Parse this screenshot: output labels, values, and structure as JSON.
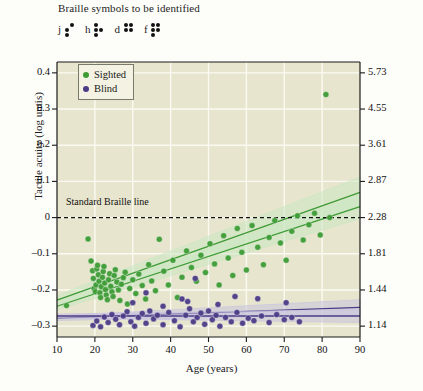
{
  "header": {
    "caption": "Braille symbols to be identified",
    "braille": [
      {
        "letter": "j",
        "dots": [
          0,
          1,
          1,
          1,
          0,
          0
        ]
      },
      {
        "letter": "h",
        "dots": [
          1,
          1,
          1,
          0,
          1,
          0
        ]
      },
      {
        "letter": "d",
        "dots": [
          1,
          1,
          0,
          1,
          1,
          0
        ]
      },
      {
        "letter": "f",
        "dots": [
          1,
          1,
          1,
          1,
          1,
          0
        ]
      }
    ]
  },
  "legend": {
    "position": "top-left-inside",
    "items": [
      {
        "label": "Sighted",
        "color": "#3d9b35"
      },
      {
        "label": "Blind",
        "color": "#4b3b86"
      }
    ]
  },
  "annotations": {
    "standard_braille_line": "Standard Braille line"
  },
  "colors": {
    "plot_background": "#e7e5cd",
    "grid": "#fbfaf2",
    "sighted": "#3d9b35",
    "blind": "#4b3b86",
    "sighted_band": "#cbe7c3",
    "blind_band": "#c9c4e0",
    "axis": "#1b1b1b",
    "page_background": "#fdfdfa"
  },
  "chart_data": {
    "type": "scatter",
    "title": "",
    "xlabel": "Age (years)",
    "ylabel": "Tactile acuity (log untis)",
    "ylabel_right": "Tactile acuity (mm)",
    "xlim": [
      10,
      90
    ],
    "ylim": [
      -0.33,
      0.43
    ],
    "grid": true,
    "xticks": [
      10,
      20,
      30,
      40,
      50,
      60,
      70,
      80,
      90
    ],
    "xticklabels": [
      "10",
      "20",
      "30",
      "40",
      "50",
      "60",
      "70",
      "80",
      "90"
    ],
    "yticks": [
      0.4,
      0.3,
      0.2,
      0.1,
      0,
      -0.1,
      -0.2,
      -0.3
    ],
    "yticklabels": [
      "0.4",
      "0.3",
      "0.2",
      "0.1",
      "0",
      "–0.1",
      "–0.2",
      "–0.3"
    ],
    "y2ticks": [
      0.4,
      0.3,
      0.2,
      0.1,
      0.0,
      -0.1,
      -0.2,
      -0.3
    ],
    "y2ticklabels": [
      "5.73",
      "4.55",
      "3.61",
      "2.87",
      "2.28",
      "1.81",
      "1.44",
      "1.14"
    ],
    "hlines": [
      {
        "y": 0,
        "style": "dashed",
        "label": "Standard Braille line"
      }
    ],
    "series": [
      {
        "name": "Sighted",
        "color": "#3d9b35",
        "points": [
          [
            12.5,
            -0.243
          ],
          [
            18.2,
            -0.059
          ],
          [
            19.0,
            -0.12
          ],
          [
            19.4,
            -0.147
          ],
          [
            19.6,
            -0.168
          ],
          [
            19.8,
            -0.196
          ],
          [
            20.1,
            -0.205
          ],
          [
            20.3,
            -0.186
          ],
          [
            20.5,
            -0.142
          ],
          [
            20.7,
            -0.132
          ],
          [
            20.9,
            -0.158
          ],
          [
            21.1,
            -0.176
          ],
          [
            21.3,
            -0.208
          ],
          [
            21.5,
            -0.221
          ],
          [
            21.7,
            -0.191
          ],
          [
            22.0,
            -0.165
          ],
          [
            22.2,
            -0.149
          ],
          [
            22.4,
            -0.135
          ],
          [
            22.6,
            -0.181
          ],
          [
            22.8,
            -0.199
          ],
          [
            23.0,
            -0.214
          ],
          [
            23.3,
            -0.227
          ],
          [
            23.6,
            -0.172
          ],
          [
            23.9,
            -0.155
          ],
          [
            24.2,
            -0.19
          ],
          [
            24.5,
            -0.205
          ],
          [
            24.8,
            -0.218
          ],
          [
            25.1,
            -0.16
          ],
          [
            25.4,
            -0.144
          ],
          [
            25.8,
            -0.178
          ],
          [
            26.2,
            -0.2
          ],
          [
            26.6,
            -0.229
          ],
          [
            27.0,
            -0.184
          ],
          [
            27.5,
            -0.166
          ],
          [
            28.0,
            -0.151
          ],
          [
            28.6,
            -0.239
          ],
          [
            29.2,
            -0.196
          ],
          [
            30.0,
            -0.172
          ],
          [
            30.8,
            -0.21
          ],
          [
            31.6,
            -0.156
          ],
          [
            32.5,
            -0.188
          ],
          [
            33.4,
            -0.225
          ],
          [
            34.2,
            -0.13
          ],
          [
            35.0,
            -0.175
          ],
          [
            36.0,
            -0.202
          ],
          [
            37.0,
            -0.06
          ],
          [
            38.2,
            -0.148
          ],
          [
            39.4,
            -0.186
          ],
          [
            40.6,
            -0.118
          ],
          [
            41.8,
            -0.221
          ],
          [
            43.0,
            -0.165
          ],
          [
            44.2,
            -0.092
          ],
          [
            45.5,
            -0.138
          ],
          [
            46.8,
            -0.176
          ],
          [
            48.0,
            -0.104
          ],
          [
            49.2,
            -0.152
          ],
          [
            50.4,
            -0.072
          ],
          [
            51.6,
            -0.128
          ],
          [
            52.8,
            -0.186
          ],
          [
            54.0,
            -0.05
          ],
          [
            55.2,
            -0.112
          ],
          [
            56.4,
            -0.16
          ],
          [
            57.6,
            -0.03
          ],
          [
            58.8,
            -0.096
          ],
          [
            60.0,
            -0.145
          ],
          [
            61.5,
            -0.022
          ],
          [
            63.0,
            -0.082
          ],
          [
            64.5,
            -0.13
          ],
          [
            66.0,
            -0.055
          ],
          [
            67.5,
            -0.008
          ],
          [
            69.0,
            -0.07
          ],
          [
            70.5,
            -0.118
          ],
          [
            72.0,
            -0.038
          ],
          [
            73.5,
            0.005
          ],
          [
            75.0,
            -0.062
          ],
          [
            76.5,
            -0.02
          ],
          [
            78.0,
            0.012
          ],
          [
            79.5,
            -0.048
          ],
          [
            81.0,
            0.34
          ],
          [
            82.0,
            0.0
          ]
        ]
      },
      {
        "name": "Blind",
        "color": "#4b3b86",
        "points": [
          [
            19.5,
            -0.298
          ],
          [
            20.5,
            -0.286
          ],
          [
            21.5,
            -0.302
          ],
          [
            22.5,
            -0.275
          ],
          [
            23.5,
            -0.29
          ],
          [
            24.5,
            -0.268
          ],
          [
            25.5,
            -0.281
          ],
          [
            26.5,
            -0.296
          ],
          [
            27.5,
            -0.272
          ],
          [
            28.5,
            -0.26
          ],
          [
            29.5,
            -0.288
          ],
          [
            30.5,
            -0.3
          ],
          [
            31.5,
            -0.276
          ],
          [
            32.5,
            -0.265
          ],
          [
            33.5,
            -0.292
          ],
          [
            34.5,
            -0.258
          ],
          [
            35.5,
            -0.28
          ],
          [
            36.5,
            -0.27
          ],
          [
            38.0,
            -0.296
          ],
          [
            39.5,
            -0.262
          ],
          [
            41.0,
            -0.285
          ],
          [
            42.5,
            -0.302
          ],
          [
            44.0,
            -0.27
          ],
          [
            45.0,
            -0.252
          ],
          [
            46.0,
            -0.288
          ],
          [
            47.0,
            -0.276
          ],
          [
            48.0,
            -0.264
          ],
          [
            49.0,
            -0.295
          ],
          [
            50.0,
            -0.258
          ],
          [
            51.0,
            -0.282
          ],
          [
            52.0,
            -0.27
          ],
          [
            53.0,
            -0.3
          ],
          [
            54.5,
            -0.276
          ],
          [
            56.0,
            -0.288
          ],
          [
            57.5,
            -0.262
          ],
          [
            59.0,
            -0.292
          ],
          [
            60.5,
            -0.278
          ],
          [
            62.0,
            -0.285
          ],
          [
            64.0,
            -0.272
          ],
          [
            66.0,
            -0.29
          ],
          [
            68.0,
            -0.268
          ],
          [
            70.0,
            -0.282
          ],
          [
            72.0,
            -0.276
          ],
          [
            74.0,
            -0.288
          ],
          [
            30.0,
            -0.235
          ],
          [
            44.5,
            -0.232
          ],
          [
            52.5,
            -0.24
          ],
          [
            70.5,
            -0.235
          ],
          [
            38.0,
            -0.245
          ],
          [
            46.5,
            -0.168
          ],
          [
            33.5,
            -0.208
          ],
          [
            43.0,
            -0.225
          ],
          [
            57.0,
            -0.218
          ],
          [
            63.0,
            -0.224
          ]
        ]
      }
    ],
    "regressions": [
      {
        "series": "Sighted",
        "id": "sighted-upper",
        "x0": 10,
        "y0": -0.228,
        "x1": 90,
        "y1": 0.07,
        "band": 0.028
      },
      {
        "series": "Sighted",
        "id": "sighted-lower",
        "x0": 10,
        "y0": -0.245,
        "x1": 90,
        "y1": 0.03,
        "band": 0.022
      },
      {
        "series": "Blind",
        "id": "blind-upper",
        "x0": 10,
        "y0": -0.278,
        "x1": 90,
        "y1": -0.248,
        "band": 0.014
      },
      {
        "series": "Blind",
        "id": "blind-lower",
        "x0": 10,
        "y0": -0.272,
        "x1": 90,
        "y1": -0.272,
        "band": 0.012
      }
    ]
  }
}
